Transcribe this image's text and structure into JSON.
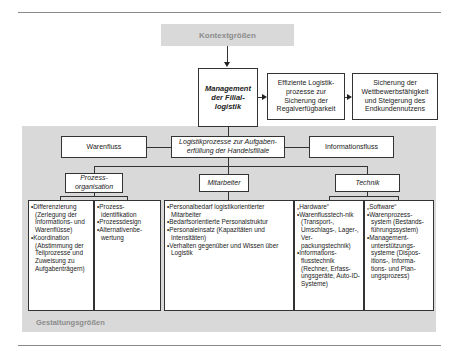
{
  "context": {
    "label": "Kontextgrößen"
  },
  "management": {
    "line1": "Management",
    "line2": "der Filial-",
    "line3": "logistik"
  },
  "outcome1": {
    "line1": "Effiziente Logistik-",
    "line2": "prozesse zur",
    "line3": "Sicherung der",
    "line4": "Regalverfügbarkeit"
  },
  "outcome2": {
    "line1": "Sicherung der",
    "line2": "Wettbewerbsfähigkeit",
    "line3": "und Steigerung des",
    "line4": "Endkundennutzens"
  },
  "flows": {
    "left": "Warenfluss",
    "center_line1": "Logistikprozesse zur Aufgaben-",
    "center_line2": "erfüllung der Handelsfiliale",
    "right": "Informationsfluss"
  },
  "dimensions": {
    "process_line1": "Prozess-",
    "process_line2": "organisation",
    "staff": "Mitarbeiter",
    "tech": "Technik"
  },
  "details": {
    "process_a": [
      "Differenzierung (Zerlegung der Informations- und Warenflüsse)",
      "Koordination (Abstimmung der Teilprozesse und Zuweisung zu Aufgabenträgern)"
    ],
    "process_b": [
      "Prozess-identifikation",
      "Prozessdesign",
      "Alternativenbe-wertung"
    ],
    "staff": [
      "Personalbedarf logistikorientierter Mitarbeiter",
      "Bedarfsorientierte Personalstruktur",
      "Personaleinsatz (Kapazitäten und Intensitäten)",
      "Verhalten gegenüber und Wissen über Logistik"
    ],
    "hardware_header": "„Hardware“",
    "hardware": [
      "Warenflusstech-nik (Transport-, Umschlags-, Lager-, Ver-packungstechnik)",
      "Informations-flusstechnik (Rechner, Erfass-ungsgeräte, Auto-ID-Systeme)"
    ],
    "software_header": "„Software“",
    "software": [
      "Warenprozess-system (Bestands-führungssystem)",
      "Management-unterstützungs-systeme (Dispos-itions-, Informa-tions- und Plan-ungsprozess)"
    ]
  },
  "design": {
    "label": "Gestaltungsgrößen"
  },
  "colors": {
    "band": "#d9d9d9",
    "line": "#333333",
    "label_gray": "#8c8c8c"
  }
}
